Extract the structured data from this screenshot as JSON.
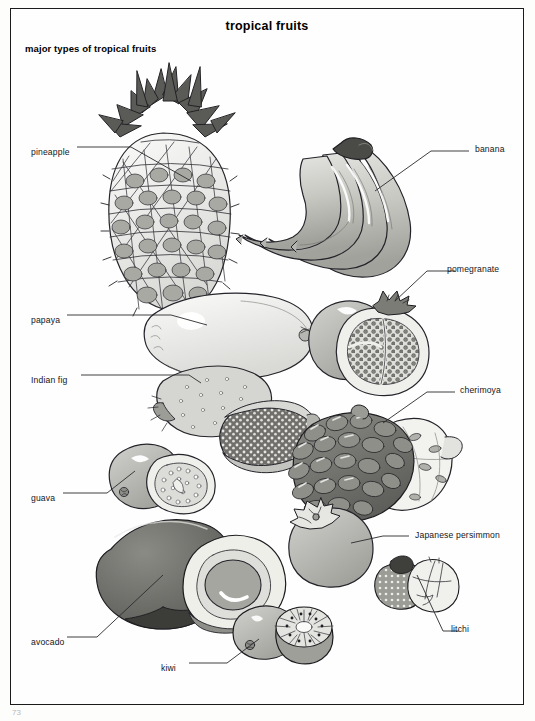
{
  "plate": {
    "title": "tropical fruits",
    "subtitle": "major types of tropical fruits",
    "page_number": "73",
    "ink_color": "#1b1b1b",
    "paper_color": "#fefefe"
  },
  "labels": [
    {
      "id": "pineapple",
      "text": "pineapple",
      "side": "left",
      "x": 30,
      "y": 145
    },
    {
      "id": "papaya",
      "text": "papaya",
      "side": "left",
      "x": 30,
      "y": 313
    },
    {
      "id": "indian-fig",
      "text": "Indian fig",
      "side": "left",
      "x": 30,
      "y": 373
    },
    {
      "id": "guava",
      "text": "guava",
      "side": "left",
      "x": 30,
      "y": 491
    },
    {
      "id": "avocado",
      "text": "avocado",
      "side": "left",
      "x": 30,
      "y": 637
    },
    {
      "id": "kiwi",
      "text": "kiwi",
      "side": "left",
      "x": 160,
      "y": 661
    },
    {
      "id": "banana",
      "text": "banana",
      "side": "right",
      "x": 476,
      "y": 148
    },
    {
      "id": "pomegranate",
      "text": "pomegranate",
      "side": "right",
      "x": 448,
      "y": 268
    },
    {
      "id": "cherimoya",
      "text": "cherimoya",
      "side": "right",
      "x": 461,
      "y": 389
    },
    {
      "id": "japanese-persimmon",
      "text": "Japanese persimmon",
      "side": "right",
      "x": 416,
      "y": 534
    },
    {
      "id": "litchi",
      "text": "litchi",
      "side": "right",
      "x": 452,
      "y": 628
    }
  ],
  "illustrations": [
    {
      "id": "pineapple",
      "name": "pineapple",
      "note": "whole fruit with spiky crown"
    },
    {
      "id": "banana",
      "name": "banana",
      "note": "bunch of four bananas"
    },
    {
      "id": "papaya",
      "name": "papaya",
      "note": "whole elongated fruit"
    },
    {
      "id": "pomegranate",
      "name": "pomegranate",
      "note": "whole fruit and cut half showing arils"
    },
    {
      "id": "indian-fig",
      "name": "Indian fig",
      "note": "whole prickly pear and cut half"
    },
    {
      "id": "guava",
      "name": "guava",
      "note": "whole fruit and cut half with seeds"
    },
    {
      "id": "cherimoya",
      "name": "cherimoya",
      "note": "whole scaly fruit and cut section"
    },
    {
      "id": "japanese-persimmon",
      "name": "Japanese persimmon",
      "note": "round fruit with calyx"
    },
    {
      "id": "avocado",
      "name": "avocado",
      "note": "whole fruit and cut half with pit"
    },
    {
      "id": "litchi",
      "name": "litchi",
      "note": "rough-skinned fruit and peeled fruit"
    },
    {
      "id": "kiwi",
      "name": "kiwi",
      "note": "whole fruit and cut half showing radial flesh"
    }
  ]
}
